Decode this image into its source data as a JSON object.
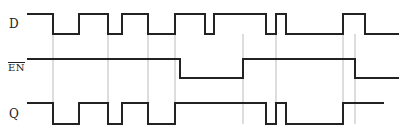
{
  "labels": {
    "d": "D",
    "en": "EN",
    "q": "Q"
  },
  "colors": {
    "signal": "#222222",
    "guide": "#bbbbbb",
    "background": "#ffffff"
  },
  "signals": {
    "d": {
      "high_y": 14,
      "low_y": 34,
      "start_x": 27,
      "end_x": 399,
      "initial": "high",
      "transitions": [
        53,
        79,
        108,
        122,
        148,
        175,
        205,
        214,
        266,
        276,
        286,
        343,
        365
      ]
    },
    "en": {
      "high_y": 59,
      "low_y": 78,
      "start_x": 27,
      "end_x": 399,
      "initial": "high",
      "transitions": [
        180,
        243,
        355
      ]
    },
    "q": {
      "high_y": 103,
      "low_y": 124,
      "start_x": 27,
      "end_x": 384,
      "initial": "high",
      "transitions": [
        53,
        79,
        108,
        122,
        148,
        175,
        266,
        276,
        286,
        343
      ]
    }
  },
  "guides": {
    "top_y": 34,
    "bottom_y": 124,
    "x": [
      53,
      108,
      148,
      175,
      243,
      276,
      343,
      355
    ]
  }
}
